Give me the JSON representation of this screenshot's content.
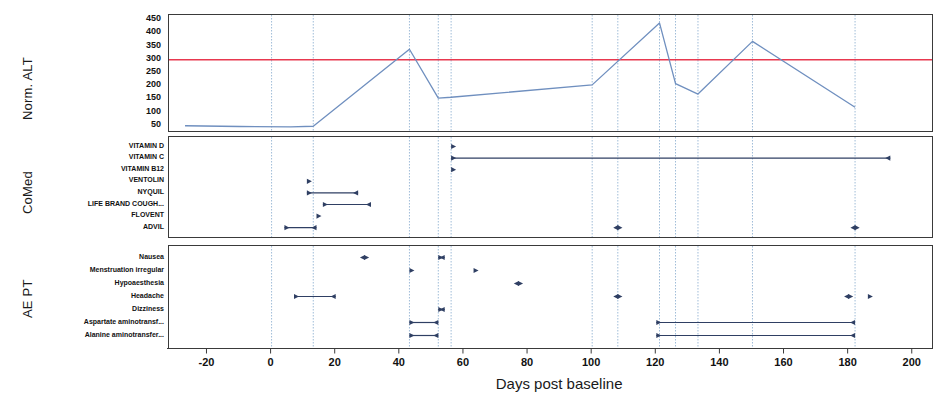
{
  "figure": {
    "xaxis_title": "Days post baseline",
    "x_ticks": [
      -20,
      0,
      20,
      40,
      60,
      80,
      100,
      120,
      140,
      160,
      180,
      200
    ],
    "x_range": [
      -32,
      206
    ],
    "reference_line_color": "#e8384f",
    "series_color": "#6f8fbf",
    "event_color": "#2f3f63",
    "gridline_color": "#9fbcd8",
    "panels": [
      {
        "key": "alt",
        "label": "Norm. ALT"
      },
      {
        "key": "comed",
        "label": "CoMed"
      },
      {
        "key": "ae",
        "label": "AE PT"
      }
    ]
  },
  "chart_data": [
    {
      "type": "line",
      "title": "Norm. ALT",
      "xlabel": "Days post baseline",
      "ylabel": "Norm. ALT",
      "xlim": [
        -32,
        206
      ],
      "ylim": [
        30,
        470
      ],
      "grid": true,
      "legend": "none",
      "ytick_labels": [
        450,
        400,
        350,
        300,
        250,
        200,
        150,
        100,
        50
      ],
      "reference_line": {
        "y": 300,
        "color": "#e8384f",
        "label": "300"
      },
      "series": [
        {
          "name": "Norm. ALT",
          "color": "#6f8fbf",
          "x": [
            -27,
            -10,
            6,
            13,
            43,
            52,
            56,
            100,
            121,
            126,
            133,
            150,
            182
          ],
          "y": [
            50,
            47,
            46,
            48,
            340,
            155,
            158,
            205,
            440,
            210,
            170,
            370,
            120
          ]
        }
      ],
      "gridlines_x": [
        0,
        13,
        43,
        52,
        56,
        100,
        108,
        121,
        126,
        133,
        150,
        182
      ]
    },
    {
      "type": "timeline",
      "title": "CoMed",
      "xlabel": "Days post baseline",
      "xlim": [
        -32,
        206
      ],
      "categories": [
        "VITAMIN D",
        "VITAMIN C",
        "VITAMIN B12",
        "VENTOLIN",
        "NYQUIL",
        "LIFE BRAND COUGH...",
        "FLOVENT",
        "ADVIL"
      ],
      "events": [
        {
          "category": "VITAMIN D",
          "start": 56,
          "end": null,
          "start_cap": "right-arrow",
          "end_cap": null
        },
        {
          "category": "VITAMIN C",
          "start": 56,
          "end": 193,
          "start_cap": "right-arrow",
          "end_cap": "left-arrow"
        },
        {
          "category": "VITAMIN B12",
          "start": 56,
          "end": null,
          "start_cap": "right-arrow",
          "end_cap": null
        },
        {
          "category": "VENTOLIN",
          "start": 11,
          "end": null,
          "start_cap": "right-arrow",
          "end_cap": null
        },
        {
          "category": "NYQUIL",
          "start": 11,
          "end": 27,
          "start_cap": "right-arrow",
          "end_cap": "left-arrow"
        },
        {
          "category": "LIFE BRAND COUGH...",
          "start": 16,
          "end": 31,
          "start_cap": "right-arrow",
          "end_cap": "left-arrow"
        },
        {
          "category": "FLOVENT",
          "start": 14,
          "end": null,
          "start_cap": "right-arrow",
          "end_cap": null
        },
        {
          "category": "ADVIL",
          "start": 4,
          "end": 14,
          "start_cap": "right-arrow",
          "end_cap": "left-arrow"
        },
        {
          "category": "ADVIL",
          "start": 108,
          "end": 108,
          "start_cap": "right-arrow",
          "end_cap": "left-arrow"
        },
        {
          "category": "ADVIL",
          "start": 182,
          "end": 182,
          "start_cap": "right-arrow",
          "end_cap": "left-arrow"
        }
      ],
      "gridlines_x": [
        0,
        13,
        43,
        52,
        56,
        100,
        108,
        121,
        126,
        133,
        150,
        182
      ]
    },
    {
      "type": "timeline",
      "title": "AE PT",
      "xlabel": "Days post baseline",
      "xlim": [
        -32,
        206
      ],
      "categories": [
        "Nausea",
        "Menstruation irregular",
        "Hypoaesthesia",
        "Headache",
        "Dizziness",
        "Aspartate aminotransf...",
        "Alanine aminotransfer..."
      ],
      "events": [
        {
          "category": "Nausea",
          "start": 29,
          "end": 29,
          "start_cap": "right-arrow",
          "end_cap": "left-arrow"
        },
        {
          "category": "Nausea",
          "start": 52,
          "end": 54,
          "start_cap": "right-arrow",
          "end_cap": "left-arrow"
        },
        {
          "category": "Menstruation irregular",
          "start": 43,
          "end": null,
          "start_cap": "right-arrow",
          "end_cap": null
        },
        {
          "category": "Menstruation irregular",
          "start": 63,
          "end": null,
          "start_cap": "right-arrow",
          "end_cap": null
        },
        {
          "category": "Hypoaesthesia",
          "start": 77,
          "end": 77,
          "start_cap": "right-arrow",
          "end_cap": "left-arrow"
        },
        {
          "category": "Headache",
          "start": 7,
          "end": 20,
          "start_cap": "right-arrow",
          "end_cap": "left-arrow"
        },
        {
          "category": "Headache",
          "start": 108,
          "end": 108,
          "start_cap": "right-arrow",
          "end_cap": "left-arrow"
        },
        {
          "category": "Headache",
          "start": 180,
          "end": 180,
          "start_cap": "right-arrow",
          "end_cap": "left-arrow"
        },
        {
          "category": "Headache",
          "start": 186,
          "end": null,
          "start_cap": "right-arrow",
          "end_cap": null
        },
        {
          "category": "Dizziness",
          "start": 52,
          "end": 54,
          "start_cap": "right-arrow",
          "end_cap": "left-arrow"
        },
        {
          "category": "Aspartate aminotransf...",
          "start": 43,
          "end": 52,
          "start_cap": "right-arrow",
          "end_cap": "left-arrow"
        },
        {
          "category": "Aspartate aminotransf...",
          "start": 120,
          "end": 182,
          "start_cap": "right-arrow",
          "end_cap": "left-arrow"
        },
        {
          "category": "Alanine aminotransfer...",
          "start": 43,
          "end": 52,
          "start_cap": "right-arrow",
          "end_cap": "left-arrow"
        },
        {
          "category": "Alanine aminotransfer...",
          "start": 120,
          "end": 182,
          "start_cap": "right-arrow",
          "end_cap": "left-arrow"
        }
      ],
      "gridlines_x": [
        0,
        13,
        43,
        52,
        56,
        100,
        108,
        121,
        126,
        133,
        150,
        182
      ]
    }
  ]
}
